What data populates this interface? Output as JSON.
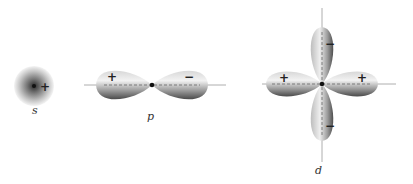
{
  "orbitals": {
    "s": {
      "label": "s",
      "sign": "+"
    },
    "p": {
      "label": "p",
      "signs": [
        "+",
        "−"
      ]
    },
    "d": {
      "label": "d",
      "signs": {
        "left": "+",
        "right": "+",
        "top": "−",
        "bottom": "−"
      }
    }
  },
  "colors": {
    "lobe_dark": "#555555",
    "lobe_light": "#f2f2f2",
    "axis": "#888888",
    "nucleus": "#111111"
  }
}
